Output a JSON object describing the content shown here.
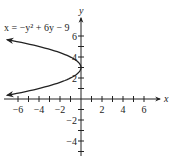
{
  "chart_data": {
    "type": "line",
    "title": "",
    "annotation": "x = −y² + 6y − 9",
    "equation": "x = -y^2 + 6y - 9",
    "xlabel": "x",
    "ylabel": "y",
    "xlim": [
      -7,
      7
    ],
    "ylim": [
      -5,
      7
    ],
    "x_ticks": [
      -6,
      -5,
      -4,
      -3,
      -2,
      -1,
      1,
      2,
      3,
      4,
      5,
      6
    ],
    "x_tick_labels": [
      "−6",
      "−4",
      "−2",
      "2",
      "4",
      "6"
    ],
    "x_tick_label_values": [
      -6,
      -4,
      -2,
      2,
      4,
      6
    ],
    "y_ticks": [
      -5,
      -4,
      -3,
      -2,
      -1,
      1,
      2,
      3,
      4,
      5,
      6
    ],
    "y_tick_labels": [
      "6",
      "4",
      "2",
      "−2",
      "−4"
    ],
    "y_tick_label_values": [
      6,
      4,
      2,
      -2,
      -4
    ],
    "grid": false,
    "series": [
      {
        "name": "x = -y^2 + 6y - 9",
        "vertex": [
          0,
          3
        ],
        "opens": "left",
        "endpoints_arrows": [
          [
            -7,
            5.65
          ],
          [
            -7,
            0.35
          ]
        ],
        "points": [
          [
            -7,
            5.65
          ],
          [
            -6.25,
            5.5
          ],
          [
            -4,
            5
          ],
          [
            -2.25,
            4.5
          ],
          [
            -1,
            4
          ],
          [
            -0.25,
            3.5
          ],
          [
            0,
            3
          ],
          [
            -0.25,
            2.5
          ],
          [
            -1,
            2
          ],
          [
            -2.25,
            1.5
          ],
          [
            -4,
            1
          ],
          [
            -6.25,
            0.5
          ],
          [
            -7,
            0.35
          ]
        ]
      }
    ],
    "legend": "none"
  },
  "colors": {
    "ink": "#222222",
    "background": "#ffffff"
  }
}
